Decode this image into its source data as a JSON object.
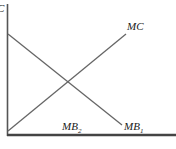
{
  "diagram": {
    "type": "economics-marginal-analysis",
    "axis_label_y": "C",
    "curves": [
      {
        "name": "MC",
        "label": "MC",
        "slope": "upward",
        "color": "#555555"
      },
      {
        "name": "MB1",
        "label": "MB",
        "subscript": "1",
        "slope": "downward",
        "color": "#555555"
      }
    ],
    "labels": {
      "mc": "MC",
      "mb1_main": "MB",
      "mb1_sub": "1",
      "mb2_main": "MB",
      "mb2_sub": "2"
    },
    "colors": {
      "axis": "#444444",
      "line": "#5a5a5a",
      "text": "#1a1a1a"
    }
  }
}
